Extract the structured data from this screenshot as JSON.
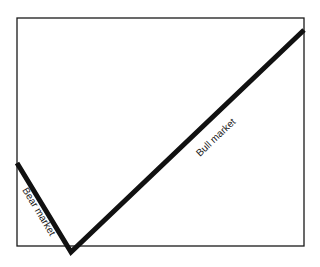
{
  "diagram": {
    "type": "market-cycle-line",
    "segments": [
      {
        "label": "Bear market",
        "direction": "down"
      },
      {
        "label": "Bull market",
        "direction": "up"
      }
    ],
    "colors": {
      "line": "#111111",
      "frame": "#1a1a1a",
      "background": "#ffffff"
    }
  }
}
